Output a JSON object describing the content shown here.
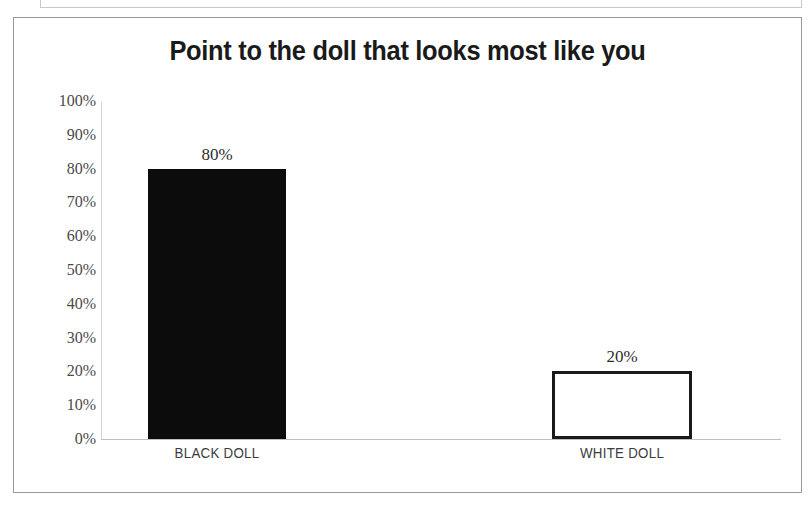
{
  "chart_data": {
    "type": "bar",
    "title": "Point to the doll that looks most like you",
    "xlabel": "",
    "ylabel": "",
    "categories": [
      "BLACK DOLL",
      "WHITE DOLL"
    ],
    "values": [
      80,
      20
    ],
    "value_labels": [
      "80%",
      "20%"
    ],
    "ylim": [
      0,
      100
    ],
    "y_ticks": [
      0,
      10,
      20,
      30,
      40,
      50,
      60,
      70,
      80,
      90,
      100
    ],
    "y_tick_labels": [
      "0%",
      "10%",
      "20%",
      "30%",
      "40%",
      "50%",
      "60%",
      "70%",
      "80%",
      "90%",
      "100%"
    ],
    "grid": false,
    "legend": false,
    "bar_styles": [
      {
        "name": "black-doll-bar",
        "fill": "#0c0c0c",
        "stroke": "#0c0c0c",
        "style": "solid"
      },
      {
        "name": "white-doll-bar",
        "fill": "#ffffff",
        "stroke": "#1a1a1a",
        "style": "outlined"
      }
    ]
  },
  "colors": {
    "frame_border": "#9a9a9a",
    "axis_line": "#bfbfbf",
    "tick_text": "#4a4a4a",
    "title_text": "#1a1a1a",
    "category_text": "#3c3c3c",
    "bar_black": "#0c0c0c",
    "bar_white": "#ffffff",
    "bar_white_outline": "#1a1a1a",
    "page_background": "#ffffff"
  }
}
